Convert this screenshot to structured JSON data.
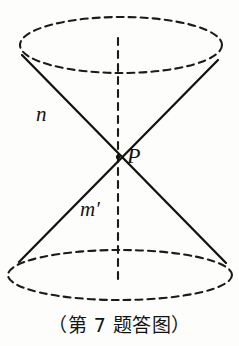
{
  "figure": {
    "caption": "（第 7 题答图）",
    "labels": {
      "slant_upper": "n",
      "vertex": "P",
      "slant_lower": "m′"
    },
    "colors": {
      "background": "#fdfdfb",
      "ink": "#14120f",
      "dashed_ink": "#1d1b18"
    },
    "geometry": {
      "top_ellipse": {
        "cx": 121,
        "cy": 45,
        "rx": 101,
        "ry": 28,
        "stroke": "dashed"
      },
      "bottom_ellipse": {
        "cx": 120,
        "cy": 275,
        "rx": 112,
        "ry": 25,
        "stroke": "dashed"
      },
      "vertex_point": {
        "x": 118,
        "y": 157
      },
      "axis": {
        "x": 118,
        "y_top": 38,
        "y_bottom": 280,
        "stroke": "dashed"
      },
      "slant_lines": [
        {
          "name": "upper-left-to-lower-right",
          "x1": 22,
          "y1": 55,
          "x2": 226,
          "y2": 263
        },
        {
          "name": "upper-right-to-lower-left",
          "x1": 218,
          "y1": 60,
          "x2": 19,
          "y2": 262
        }
      ]
    }
  }
}
